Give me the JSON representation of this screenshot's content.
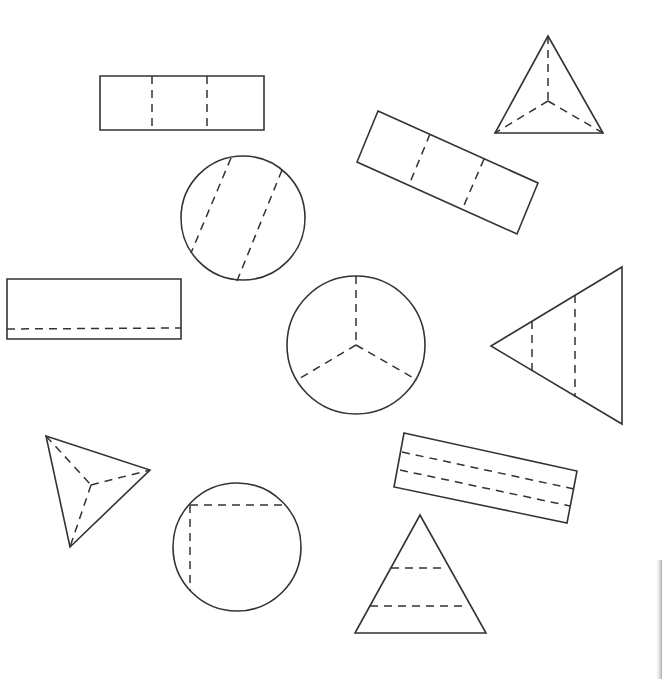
{
  "diagram": {
    "colors": {
      "line": "#333333",
      "background": "#ffffff"
    },
    "shapes": [
      {
        "id": "rect-top",
        "type": "rectangle",
        "parts": 3,
        "division": "two vertical dashed lines, equal thirds",
        "outline": [
          [
            100,
            76
          ],
          [
            264,
            76
          ],
          [
            264,
            130
          ],
          [
            100,
            130
          ]
        ],
        "dashes": [
          [
            [
              152,
              76
            ],
            [
              152,
              130
            ]
          ],
          [
            [
              207,
              76
            ],
            [
              207,
              130
            ]
          ]
        ]
      },
      {
        "id": "triangle-top-right",
        "type": "triangle",
        "parts": 3,
        "division": "dashed lines from centroid to each vertex",
        "outline": [
          [
            548,
            36
          ],
          [
            495,
            133
          ],
          [
            603,
            133
          ]
        ],
        "dashes": [
          [
            [
              548,
              36
            ],
            [
              548,
              101
            ]
          ],
          [
            [
              548,
              101
            ],
            [
              495,
              133
            ]
          ],
          [
            [
              548,
              101
            ],
            [
              603,
              133
            ]
          ]
        ]
      },
      {
        "id": "rect-rotated",
        "type": "rectangle",
        "parts": 3,
        "division": "two dashed lines across the width, equal thirds",
        "outline": [
          [
            378,
            111
          ],
          [
            538,
            183
          ],
          [
            517,
            234
          ],
          [
            357,
            162
          ]
        ],
        "dashes": [
          [
            [
              430,
              134
            ],
            [
              409,
              185
            ]
          ],
          [
            [
              484,
              159
            ],
            [
              462,
              210
            ]
          ]
        ]
      },
      {
        "id": "circle-diagonal",
        "type": "circle",
        "parts": 3,
        "division": "two parallel diagonal dashed chords (unequal parts)",
        "center": [
          243,
          218
        ],
        "radius": 62,
        "dashes": [
          [
            [
              231,
              158
            ],
            [
              191,
              253
            ]
          ],
          [
            [
              282,
              170
            ],
            [
              237,
              281
            ]
          ]
        ]
      },
      {
        "id": "rect-left",
        "type": "rectangle",
        "parts": 2,
        "division": "one horizontal dashed line near bottom (unequal parts)",
        "outline": [
          [
            7,
            279
          ],
          [
            181,
            279
          ],
          [
            181,
            339
          ],
          [
            7,
            339
          ]
        ],
        "dashes": [
          [
            [
              7,
              329
            ],
            [
              181,
              328
            ]
          ]
        ]
      },
      {
        "id": "circle-center",
        "type": "circle",
        "parts": 3,
        "division": "three dashed radii at 120 degrees, equal thirds",
        "center": [
          356,
          345
        ],
        "radius": 69,
        "dashes": [
          [
            [
              356,
              276
            ],
            [
              356,
              345
            ]
          ],
          [
            [
              356,
              345
            ],
            [
              297,
              380
            ]
          ],
          [
            [
              356,
              345
            ],
            [
              417,
              380
            ]
          ]
        ]
      },
      {
        "id": "triangle-right",
        "type": "triangle",
        "parts": 3,
        "division": "two vertical dashed lines (unequal parts)",
        "outline": [
          [
            491,
            346
          ],
          [
            622,
            267
          ],
          [
            622,
            424
          ]
        ],
        "dashes": [
          [
            [
              532,
              321
            ],
            [
              532,
              371
            ]
          ],
          [
            [
              575,
              295
            ],
            [
              575,
              397
            ]
          ]
        ]
      },
      {
        "id": "triangle-bottom-left",
        "type": "triangle",
        "parts": 3,
        "division": "dashed lines from interior point to each vertex",
        "outline": [
          [
            46,
            436
          ],
          [
            150,
            470
          ],
          [
            70,
            547
          ]
        ],
        "dashes": [
          [
            [
              46,
              436
            ],
            [
              91,
              485
            ]
          ],
          [
            [
              91,
              485
            ],
            [
              150,
              470
            ]
          ],
          [
            [
              91,
              485
            ],
            [
              70,
              547
            ]
          ]
        ]
      },
      {
        "id": "rect-bottom-right",
        "type": "rectangle",
        "parts": 3,
        "division": "two dashed lines along the length",
        "outline": [
          [
            404,
            433
          ],
          [
            577,
            471
          ],
          [
            567,
            523
          ],
          [
            394,
            487
          ]
        ],
        "dashes": [
          [
            [
              402,
              452
            ],
            [
              574,
              489
            ]
          ],
          [
            [
              400,
              470
            ],
            [
              570,
              506
            ]
          ]
        ]
      },
      {
        "id": "circle-bottom",
        "type": "circle",
        "parts": 3,
        "division": "one horizontal and one vertical dashed chord forming a corner",
        "center": [
          237,
          547
        ],
        "radius": 64,
        "dashes": [
          [
            [
              190,
              505
            ],
            [
              285,
              505
            ]
          ],
          [
            [
              190,
              505
            ],
            [
              190,
              591
            ]
          ]
        ]
      },
      {
        "id": "triangle-bottom",
        "type": "triangle",
        "parts": 3,
        "division": "two horizontal dashed lines (unequal parts)",
        "outline": [
          [
            420,
            515
          ],
          [
            355,
            633
          ],
          [
            486,
            633
          ]
        ],
        "dashes": [
          [
            [
              391,
              568
            ],
            [
              447,
              568
            ]
          ],
          [
            [
              370,
              606
            ],
            [
              467,
              606
            ]
          ]
        ]
      }
    ]
  }
}
